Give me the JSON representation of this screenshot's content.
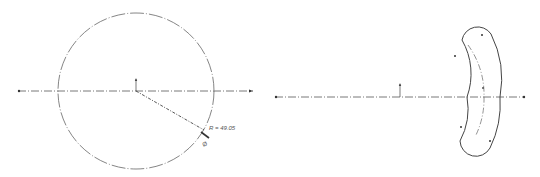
{
  "colors": {
    "line": "#555555",
    "centerline": "#666666",
    "background": "#ffffff"
  },
  "left_view": {
    "shape": "circle",
    "center": [
      136,
      91
    ],
    "radius_px": 78,
    "axis": {
      "y": 91,
      "x_start": 18,
      "x_end": 253
    },
    "dimension": {
      "label": "R = 49.05",
      "leader_from": [
        136,
        91
      ],
      "leader_to": [
        204,
        130
      ],
      "symbol": "radius-dimension-icon"
    }
  },
  "right_view": {
    "shape": "arc-slot",
    "center_marker": [
      400,
      97
    ],
    "axis": {
      "y": 97,
      "x_start": 275,
      "x_end": 525
    },
    "slot": {
      "arc_center": [
        400,
        97
      ],
      "centerline_radius": 84,
      "half_width": 16,
      "start_angle_deg": -38,
      "end_angle_deg": 35
    }
  }
}
